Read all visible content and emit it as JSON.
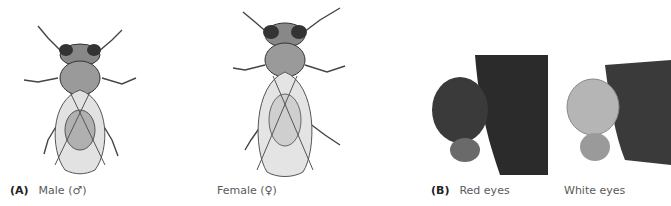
{
  "figure": {
    "panel_a": {
      "label": "(A)",
      "male": {
        "caption": "Male (♂)"
      },
      "female": {
        "caption": "Female (♀)"
      }
    },
    "panel_b": {
      "label": "(B)",
      "red_eyes": {
        "caption": "Red eyes"
      },
      "white_eyes": {
        "caption": "White eyes"
      }
    }
  }
}
